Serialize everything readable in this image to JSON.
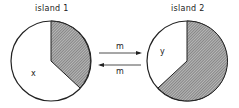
{
  "islands": [
    {
      "title": "island 1",
      "variable": "x",
      "shaded_fraction": 0.36
    },
    {
      "title": "island 2",
      "variable": "y",
      "shaded_fraction": 0.64
    }
  ],
  "migration": {
    "top_label": "m",
    "bottom_label": "m"
  },
  "colors": {
    "outline": "#222222",
    "shade": "#8a8a8a",
    "background": "#ffffff"
  }
}
